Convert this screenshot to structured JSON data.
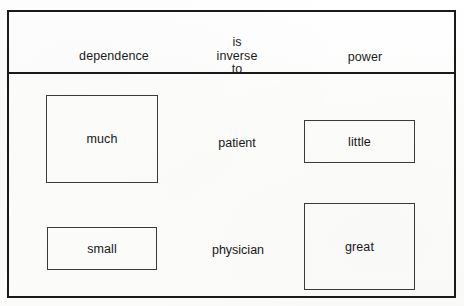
{
  "figure": {
    "columns": {
      "left_header": "dependence",
      "middle_header_lines": [
        "is",
        "inverse",
        "to"
      ],
      "right_header": "power"
    },
    "rows": [
      {
        "subject": "patient",
        "dependence_label": "much",
        "power_label": "little"
      },
      {
        "subject": "physician",
        "dependence_label": "small",
        "power_label": "great"
      }
    ],
    "colors": {
      "frame": "#1a1a1a",
      "box_border": "#3a3a3a",
      "text": "#171717",
      "background": "#fdfdfc"
    }
  },
  "chart_data": {
    "type": "bar",
    "title": "dependence is inverse to power",
    "xlabel": "",
    "ylabel": "",
    "categories": [
      "patient",
      "physician"
    ],
    "series": [
      {
        "name": "dependence",
        "values": [
          88,
          43
        ],
        "labels": [
          "much",
          "small"
        ]
      },
      {
        "name": "power",
        "values": [
          43,
          87
        ],
        "labels": [
          "little",
          "great"
        ]
      }
    ],
    "grid": false,
    "legend": "top"
  }
}
